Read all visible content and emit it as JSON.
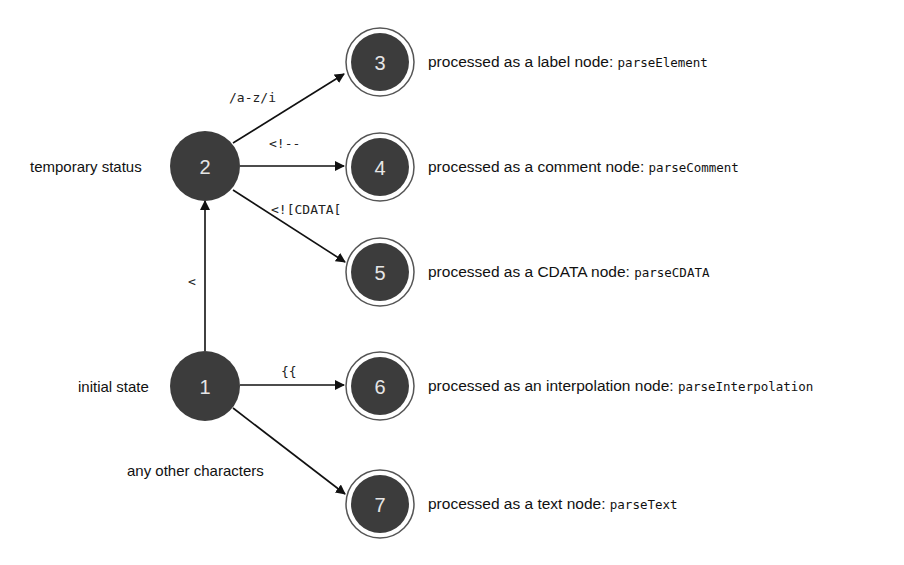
{
  "diagram": {
    "type": "state-machine",
    "colors": {
      "node_fill": "#3c3c3c",
      "node_text": "#e6e6e6",
      "edge": "#111111",
      "ring": "#555555"
    },
    "states": [
      {
        "id": "1",
        "label": "1",
        "side_label": "initial state"
      },
      {
        "id": "2",
        "label": "2",
        "side_label": "temporary status"
      },
      {
        "id": "3",
        "label": "3",
        "description": "processed as a label node: ",
        "function": "parseElement"
      },
      {
        "id": "4",
        "label": "4",
        "description": "processed as a comment node: ",
        "function": "parseComment"
      },
      {
        "id": "5",
        "label": "5",
        "description": "processed as a CDATA node: ",
        "function": "parseCDATA"
      },
      {
        "id": "6",
        "label": "6",
        "description": "processed as an interpolation node: ",
        "function": "parseInterpolation"
      },
      {
        "id": "7",
        "label": "7",
        "description": "processed as a text node: ",
        "function": "parseText"
      }
    ],
    "transitions": [
      {
        "from": "1",
        "to": "2",
        "label": "<"
      },
      {
        "from": "2",
        "to": "3",
        "label": "/a-z/i"
      },
      {
        "from": "2",
        "to": "4",
        "label": "<!--"
      },
      {
        "from": "2",
        "to": "5",
        "label": "<![CDATA["
      },
      {
        "from": "1",
        "to": "6",
        "label": "{{"
      },
      {
        "from": "1",
        "to": "7",
        "label": "any other characters"
      }
    ]
  }
}
